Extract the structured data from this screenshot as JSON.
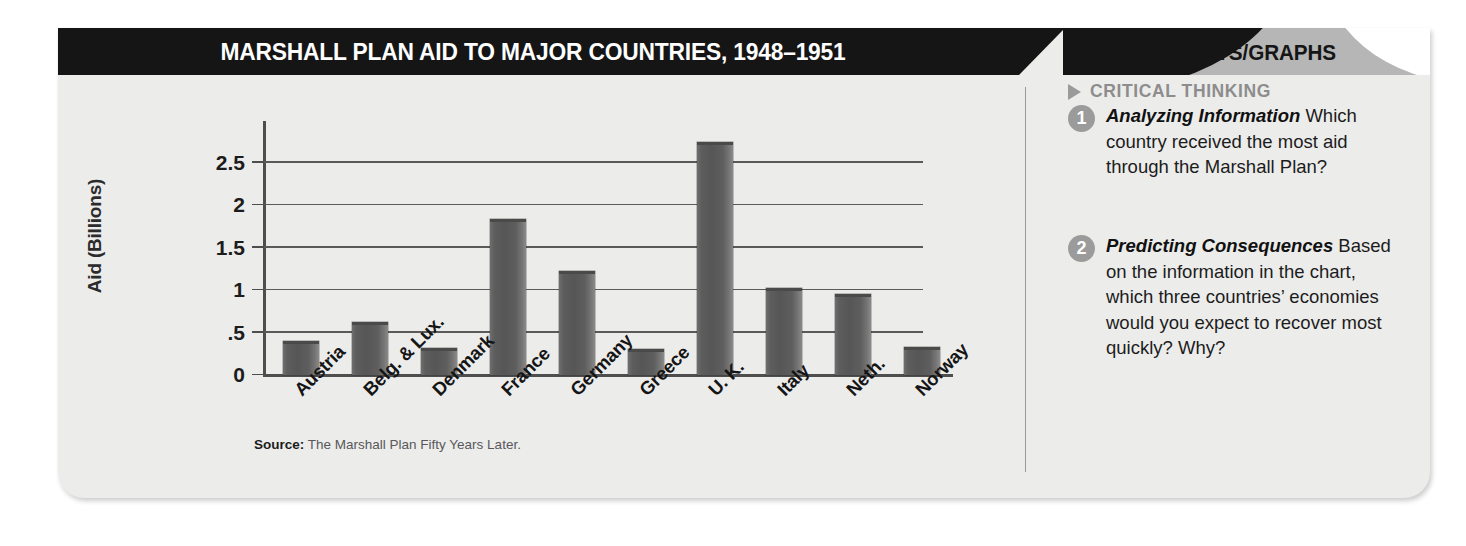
{
  "header": {
    "title": "MARSHALL PLAN AID TO MAJOR COUNTRIES, 1948–1951",
    "tab_label": "CHARTS/GRAPHS"
  },
  "sidebar": {
    "section_heading": "CRITICAL THINKING",
    "marker_icon": "triangle-right-icon",
    "questions": [
      {
        "number": "1",
        "lead": "Analyzing Information",
        "body": "Which country received the most aid through the Marshall Plan?"
      },
      {
        "number": "2",
        "lead": "Predicting Consequences",
        "body": "Based on the information in the chart, which three countries’ economies would you expect to recover most quickly? Why?"
      }
    ]
  },
  "source": {
    "label": "Source:",
    "text": "The Marshall Plan Fifty Years Later."
  },
  "colors": {
    "title_bar": "#151515",
    "tab": "#b6b6b6",
    "card_background": "#ececeb",
    "bar": "#5d5d5d",
    "gridline": "#5a5a5a",
    "heading_gray": "#8d8d8d"
  },
  "chart_data": {
    "type": "bar",
    "title": "MARSHALL PLAN AID TO MAJOR COUNTRIES, 1948–1951",
    "xlabel": "",
    "ylabel": "Aid (Billions)",
    "ylim": [
      0,
      2.85
    ],
    "yticks": [
      0,
      0.5,
      1,
      1.5,
      2,
      2.5
    ],
    "ytick_labels": [
      "0",
      ".5",
      "1",
      "1.5",
      "2",
      "2.5"
    ],
    "grid": true,
    "legend": "none",
    "categories": [
      "Austria",
      "Belg. & Lux.",
      "Denmark",
      "France",
      "Germany",
      "Greece",
      "U. K.",
      "Italy",
      "Neth.",
      "Norway"
    ],
    "values": [
      0.4,
      0.63,
      0.32,
      1.84,
      1.22,
      0.31,
      2.75,
      1.03,
      0.95,
      0.33
    ],
    "units": "Billions of dollars",
    "source": "The Marshall Plan Fifty Years Later."
  }
}
